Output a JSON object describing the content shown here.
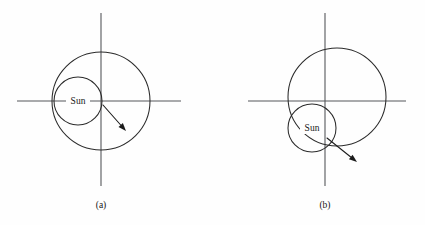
{
  "figure": {
    "background_color": "#fefefe",
    "line_color": "#2b2b2b",
    "axis_color": "#55565a",
    "width": 425,
    "height": 225
  },
  "panels": [
    {
      "id": "panel-a",
      "caption": "(a)",
      "caption_x": 101,
      "caption_y": 206,
      "origin": {
        "x": 101,
        "y": 101
      },
      "axes": {
        "horizontal": {
          "x1": 17,
          "y1": 101,
          "x2": 181,
          "y2": 101
        },
        "vertical": {
          "x1": 101,
          "y1": 13,
          "x2": 101,
          "y2": 186
        }
      },
      "orbit": {
        "cx": 101,
        "cy": 101,
        "r": 49
      },
      "sun": {
        "cx": 78,
        "cy": 101,
        "r": 24,
        "label": "Sun"
      },
      "arrow": {
        "x1": 103,
        "y1": 105,
        "x2": 126,
        "y2": 131
      }
    },
    {
      "id": "panel-b",
      "caption": "(b)",
      "caption_x": 325,
      "caption_y": 206,
      "origin": {
        "x": 325,
        "y": 101
      },
      "axes": {
        "horizontal": {
          "x1": 248,
          "y1": 101,
          "x2": 406,
          "y2": 101
        },
        "vertical": {
          "x1": 325,
          "y1": 13,
          "x2": 325,
          "y2": 186
        }
      },
      "orbit": {
        "cx": 337,
        "cy": 97,
        "r": 49
      },
      "sun": {
        "cx": 312,
        "cy": 128,
        "r": 24,
        "label": "Sun"
      },
      "arrow": {
        "x1": 327,
        "y1": 138,
        "x2": 357,
        "y2": 162
      }
    }
  ],
  "chart_data": {
    "type": "diagram",
    "annotations": [
      "Sun",
      "Sun",
      "(a)",
      "(b)"
    ],
    "series": [
      {
        "name": "(a)",
        "orbit_center": [
          101,
          101
        ],
        "orbit_radius": 49,
        "sun_center": [
          78,
          101
        ],
        "sun_radius": 24,
        "origin": [
          101,
          101
        ],
        "arrow_from": [
          103,
          105
        ],
        "arrow_to": [
          126,
          131
        ]
      },
      {
        "name": "(b)",
        "orbit_center": [
          337,
          97
        ],
        "orbit_radius": 49,
        "sun_center": [
          312,
          128
        ],
        "sun_radius": 24,
        "origin": [
          325,
          101
        ],
        "arrow_from": [
          327,
          138
        ],
        "arrow_to": [
          357,
          162
        ]
      }
    ],
    "grid": false,
    "legend": "none"
  }
}
